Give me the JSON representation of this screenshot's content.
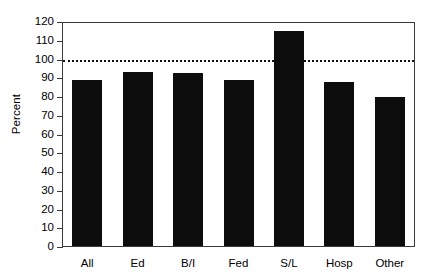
{
  "chart_data": {
    "type": "bar",
    "title": "",
    "xlabel": "",
    "ylabel": "Percent",
    "categories": [
      "All",
      "Ed",
      "B/I",
      "Fed",
      "S/L",
      "Hosp",
      "Other"
    ],
    "values": [
      89,
      93.5,
      93,
      89,
      115,
      88,
      80
    ],
    "ylim": [
      0,
      120
    ],
    "ytick_step": 10,
    "yticks": [
      0,
      10,
      20,
      30,
      40,
      50,
      60,
      70,
      80,
      90,
      100,
      110,
      120
    ],
    "ytick_labels": [
      "0",
      "10",
      "20",
      "30",
      "40",
      "50",
      "60",
      "70",
      "80",
      "90",
      "100",
      "110",
      "120"
    ],
    "grid": false,
    "legend": null,
    "legend_position": "none",
    "bar_color": "#0d0d0d",
    "frame_color": "#3a3a3a",
    "reference_line": {
      "value": 100,
      "style": "dotted",
      "color": "#111111",
      "label": ""
    }
  }
}
